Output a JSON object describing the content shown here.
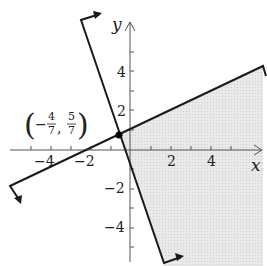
{
  "figure": {
    "problem_number": "27.",
    "type": "system of linear inequalities graph",
    "x_axis_label": "x",
    "y_axis_label": "y",
    "x_tick_labels": [
      "−4",
      "−2",
      "2",
      "4"
    ],
    "y_tick_labels": [
      "4",
      "2",
      "−2",
      "−4"
    ],
    "intersection_point": {
      "label_open": "(",
      "label_close": ")",
      "x_sign": "−",
      "x_num": "4",
      "x_den": "7",
      "comma": ",",
      "y_num": "5",
      "y_den": "7",
      "x_value": -0.5714,
      "y_value": 0.7143
    },
    "boundary_lines": [
      {
        "name": "steep line",
        "slope_direction": "negative",
        "style": "solid"
      },
      {
        "name": "shallow line",
        "slope_direction": "positive",
        "style": "solid"
      }
    ],
    "shaded_region": "right of steep line and below shallow line",
    "colors": {
      "line": "#1a1a1a",
      "axis": "#555555",
      "shading": "#e4e4e4",
      "background": "#ffffff"
    }
  }
}
